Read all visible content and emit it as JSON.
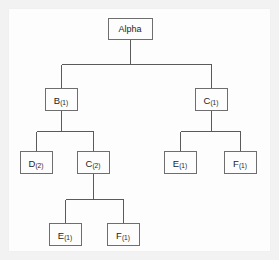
{
  "diagram": {
    "type": "tree",
    "background_color": "#f2f2f2",
    "panel_color": "#fdfdfd",
    "line_color": "#5a5a5a",
    "box_border_color": "#6e6e6e",
    "text_color": "#1c1c1c",
    "nodes": [
      {
        "id": "root",
        "label": "Alpha",
        "base": "Alpha",
        "subscript": "",
        "level": 0,
        "x": 130,
        "y": 28,
        "w": 44,
        "h": 21
      },
      {
        "id": "b1",
        "label": "B(1)",
        "base": "B",
        "subscript": "(1)",
        "level": 1,
        "x": 61,
        "y": 99,
        "w": 32,
        "h": 22
      },
      {
        "id": "c1",
        "label": "C(1)",
        "base": "C",
        "subscript": "(1)",
        "level": 1,
        "x": 211,
        "y": 99,
        "w": 32,
        "h": 22
      },
      {
        "id": "d2",
        "label": "D(2)",
        "base": "D",
        "subscript": "(2)",
        "level": 2,
        "x": 36,
        "y": 162,
        "w": 32,
        "h": 22
      },
      {
        "id": "c2",
        "label": "C(2)",
        "base": "C",
        "subscript": "(2)",
        "level": 2,
        "x": 93,
        "y": 162,
        "w": 32,
        "h": 22
      },
      {
        "id": "e1r",
        "label": "E(1)",
        "base": "E",
        "subscript": "(1)",
        "level": 2,
        "x": 180,
        "y": 162,
        "w": 32,
        "h": 22
      },
      {
        "id": "f1r",
        "label": "F(1)",
        "base": "F",
        "subscript": "(1)",
        "level": 2,
        "x": 240,
        "y": 162,
        "w": 32,
        "h": 22
      },
      {
        "id": "e1b",
        "label": "E(1)",
        "base": "E",
        "subscript": "(1)",
        "level": 3,
        "x": 65,
        "y": 234,
        "w": 32,
        "h": 22
      },
      {
        "id": "f1b",
        "label": "F(1)",
        "base": "F",
        "subscript": "(1)",
        "level": 3,
        "x": 123,
        "y": 234,
        "w": 32,
        "h": 22
      }
    ],
    "edges": [
      {
        "from": "root",
        "to": "b1"
      },
      {
        "from": "root",
        "to": "c1"
      },
      {
        "from": "b1",
        "to": "d2"
      },
      {
        "from": "b1",
        "to": "c2"
      },
      {
        "from": "c1",
        "to": "e1r"
      },
      {
        "from": "c1",
        "to": "f1r"
      },
      {
        "from": "c2",
        "to": "e1b"
      },
      {
        "from": "c2",
        "to": "f1b"
      }
    ]
  }
}
